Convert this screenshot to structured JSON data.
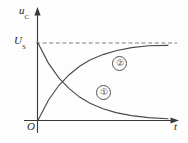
{
  "chart_data": {
    "type": "line",
    "title": "",
    "subtitle": "",
    "xlabel": "t",
    "ylabel": "u_C",
    "axis_origin_label": "O",
    "xlim": [
      0,
      1
    ],
    "ylim": [
      0,
      1.22
    ],
    "grid": false,
    "legend_position": "inline-annotations",
    "annotations": [
      {
        "id": "curve-1-tag",
        "text": "①",
        "refers_to": "discharge-curve"
      },
      {
        "id": "curve-2-tag",
        "text": "②",
        "refers_to": "charge-curve"
      }
    ],
    "reference_lines": [
      {
        "name": "Us-asymptote",
        "orientation": "horizontal",
        "value_label": "U_S",
        "style": "dashed"
      }
    ],
    "ytick_labels": [
      "U_S"
    ],
    "ytick_values": [
      1.0
    ],
    "xtick_labels": [],
    "series": [
      {
        "name": "①",
        "description": "capacitor discharge, exponential decay from U_S to 0",
        "curve_type": "exponential-decay",
        "start": [
          0,
          1.0
        ],
        "end": [
          1,
          0.02
        ],
        "x": [
          0.0,
          0.08,
          0.16,
          0.24,
          0.32,
          0.4,
          0.5,
          0.6,
          0.72,
          0.85,
          1.0
        ],
        "y": [
          1.0,
          0.74,
          0.55,
          0.41,
          0.3,
          0.22,
          0.15,
          0.1,
          0.06,
          0.035,
          0.02
        ]
      },
      {
        "name": "②",
        "description": "capacitor charge, exponential rise from 0 toward U_S",
        "curve_type": "exponential-rise",
        "start": [
          0,
          0.0
        ],
        "end": [
          1,
          0.97
        ],
        "x": [
          0.0,
          0.08,
          0.16,
          0.24,
          0.32,
          0.4,
          0.5,
          0.6,
          0.72,
          0.85,
          1.0
        ],
        "y": [
          0.0,
          0.26,
          0.45,
          0.59,
          0.7,
          0.78,
          0.85,
          0.9,
          0.94,
          0.965,
          0.97
        ]
      }
    ]
  },
  "labels": {
    "y_axis": "u",
    "y_axis_sub": "C",
    "us": "U",
    "us_sub": "S",
    "origin": "O",
    "x_axis": "t",
    "tag_one": "①",
    "tag_two": "②"
  },
  "colors": {
    "background": "#fdfdfd",
    "axis": "#3a3a3a",
    "curve": "#4a4a4a",
    "dashed": "#6e6e6e",
    "text": "#2b2b2b"
  }
}
